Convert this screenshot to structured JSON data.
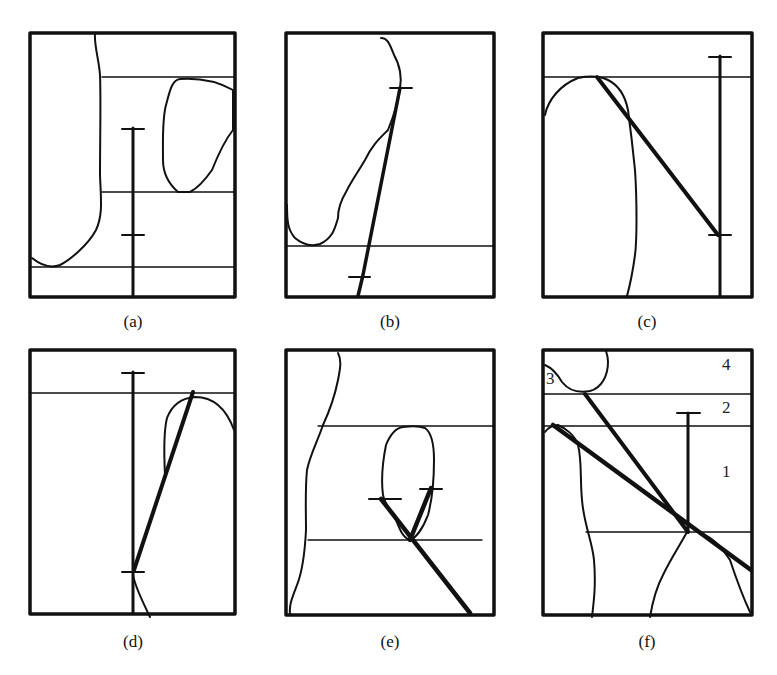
{
  "figure": {
    "panels": [
      {
        "id": "a",
        "label": "(a)"
      },
      {
        "id": "b",
        "label": "(b)"
      },
      {
        "id": "c",
        "label": "(c)"
      },
      {
        "id": "d",
        "label": "(d)"
      },
      {
        "id": "e",
        "label": "(e)"
      },
      {
        "id": "f",
        "label": "(f)",
        "region_numbers": [
          "4",
          "3",
          "2",
          "1"
        ]
      }
    ]
  },
  "colors": {
    "ink": "#111111",
    "background": "#ffffff"
  }
}
